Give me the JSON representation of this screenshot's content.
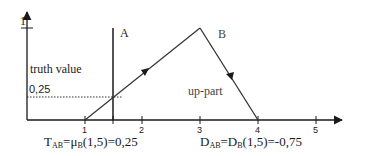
{
  "diagram": {
    "y_axis": {
      "top_tick_label": "1",
      "label": "truth value",
      "marked_value_label": "0,25"
    },
    "x_axis": {
      "tick_labels": [
        "1",
        "2",
        "3",
        "4",
        "5"
      ],
      "extra_tick_at": "1.5"
    },
    "labels": {
      "line_a": "A",
      "triangle_b": "B",
      "descending_side": "up-part"
    },
    "formulas": {
      "truth": {
        "t": "T",
        "t_sub": "AB",
        "eq1": "=μ",
        "mu_sub": "B",
        "rest": "(1,5)=0,25"
      },
      "distance": {
        "d": "D",
        "d_sub": "AB",
        "eq1": "=D",
        "d2_sub": "B",
        "rest": "(1,5)=-0,75"
      }
    },
    "colors": {
      "stroke": "#1a1a1a",
      "background": "#ffffff"
    }
  }
}
